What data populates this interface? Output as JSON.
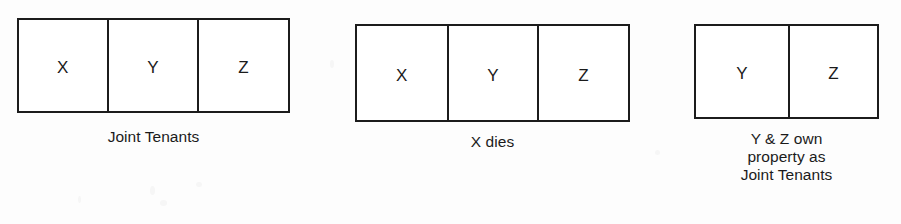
{
  "page": {
    "background_color": "#fdfdfd",
    "ink_color": "#1b1b1b"
  },
  "diagram": {
    "type": "sequence-of-box-rows",
    "groups": [
      {
        "id": "joint-tenants",
        "cells": [
          {
            "label": "X"
          },
          {
            "label": "Y"
          },
          {
            "label": "Z"
          }
        ],
        "caption": "Joint Tenants"
      },
      {
        "id": "x-dies",
        "cells": [
          {
            "label": "X"
          },
          {
            "label": "Y"
          },
          {
            "label": "Z"
          }
        ],
        "caption": "X dies"
      },
      {
        "id": "yz-own",
        "cells": [
          {
            "label": "Y"
          },
          {
            "label": "Z"
          }
        ],
        "caption": "Y & Z own\nproperty as\nJoint Tenants"
      }
    ]
  }
}
